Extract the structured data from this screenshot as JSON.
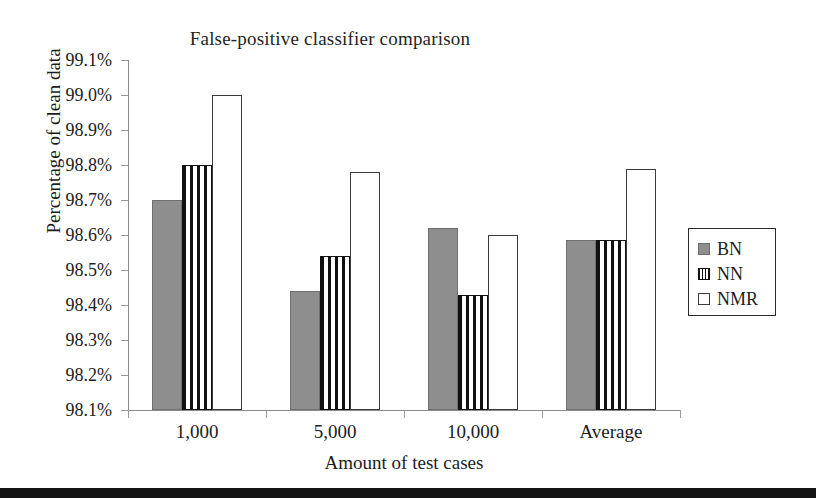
{
  "chart_data": {
    "type": "bar",
    "title": "False-positive classifier comparison",
    "xlabel": "Amount of test cases",
    "ylabel": "Percentage of clean data",
    "categories": [
      "1,000",
      "5,000",
      "10,000",
      "Average"
    ],
    "series": [
      {
        "name": "BN",
        "values": [
          98.7,
          98.44,
          98.62,
          98.585
        ]
      },
      {
        "name": "NN",
        "values": [
          98.8,
          98.54,
          98.43,
          98.585
        ]
      },
      {
        "name": "NMR",
        "values": [
          99.0,
          98.78,
          98.6,
          98.79
        ]
      }
    ],
    "ylim": [
      98.1,
      99.1
    ],
    "ytick_step": 0.1,
    "ytick_labels": [
      "99.1%",
      "99.0%",
      "98.9%",
      "98.8%",
      "98.7%",
      "98.6%",
      "98.5%",
      "98.4%",
      "98.3%",
      "98.2%",
      "98.1%"
    ],
    "ytick_values": [
      99.1,
      99.0,
      98.9,
      98.8,
      98.7,
      98.6,
      98.5,
      98.4,
      98.3,
      98.2,
      98.1
    ],
    "value_suffix": "%",
    "grid": false,
    "legend_position": "right",
    "legend_entries": [
      {
        "label": "BN",
        "swatch": "solid-gray"
      },
      {
        "label": "NN",
        "swatch": "vertical-stripes"
      },
      {
        "label": "NMR",
        "swatch": "white-outline"
      }
    ],
    "colors": {
      "bn": "#8e8e8e",
      "nn": "#111111",
      "nmr": "#ffffff",
      "axis": "#8b8b8b",
      "text": "#1c1c1c",
      "background": "#ffffff",
      "bottom_band": "#141414"
    }
  }
}
